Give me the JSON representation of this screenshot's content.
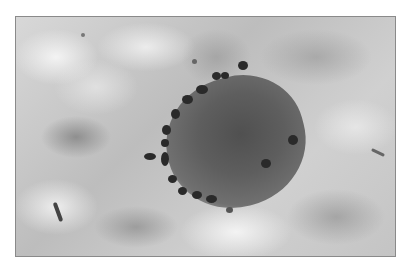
{
  "image": {
    "description": "Grayscale micrograph of a dark, roughly circular cell surrounded by a ring of dark granules against a mottled light-gray background, inside a thin gray frame",
    "colors": {
      "frame_border": "#8a8a8a",
      "background_light": "#e8e8e8",
      "background_mid": "#bdbdbd",
      "cell_body": "#555555",
      "granules": "#2a2a2a"
    }
  }
}
